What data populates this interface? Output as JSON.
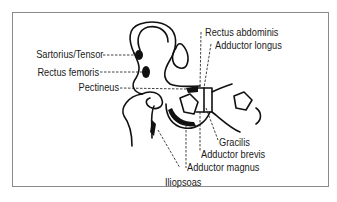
{
  "diagram": {
    "title": "",
    "colors": {
      "line": "#111111",
      "frame": "#8a8a8a",
      "text": "#1a1a1a",
      "background": "#ffffff"
    },
    "labels": {
      "sartorius_tensor": "Sartorius/Tensor",
      "rectus_femoris": "Rectus femoris",
      "pectineus": "Pectineus",
      "rectus_abdominis": "Rectus abdominis",
      "adductor_longus": "Adductor longus",
      "gracilis": "Gracilis",
      "adductor_brevis": "Adductor brevis",
      "adductor_magnus": "Adductor magnus",
      "iliopsoas": "Iliopsoas"
    }
  }
}
